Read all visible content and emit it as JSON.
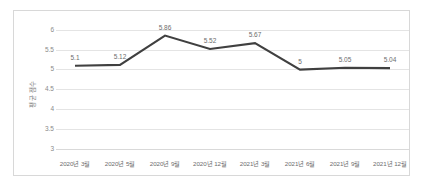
{
  "chart_data": {
    "type": "line",
    "title": "",
    "xlabel": "",
    "ylabel": "평균 점수",
    "ylim": [
      3,
      6
    ],
    "yticks": [
      6,
      5.5,
      5,
      4.5,
      4,
      3.5,
      3
    ],
    "ytick_labels": [
      "6",
      "5.5",
      "5",
      "4.5",
      "4",
      "3.5",
      "3"
    ],
    "grid": true,
    "legend": "none",
    "categories": [
      "2020년 3월",
      "2020년 5월",
      "2020년 9월",
      "2020년 12월",
      "2021년 3월",
      "2021년 6월",
      "2021년 9월",
      "2021년 12월"
    ],
    "values": [
      5.1,
      5.12,
      5.86,
      5.52,
      5.67,
      5,
      5.05,
      5.04
    ],
    "data_labels": [
      "5.1",
      "5.12",
      "5.86",
      "5.52",
      "5.67",
      "5",
      "5.05",
      "5.04"
    ],
    "series": [
      {
        "name": "평균 점수",
        "values": [
          5.1,
          5.12,
          5.86,
          5.52,
          5.67,
          5,
          5.05,
          5.04
        ]
      }
    ],
    "colors": {
      "line": "#404040",
      "grid": "#e4e4e4",
      "axis_text": "#8a8a8a",
      "label_text": "#6d6d6d",
      "border": "#d8d8d8",
      "background": "#ffffff"
    }
  }
}
